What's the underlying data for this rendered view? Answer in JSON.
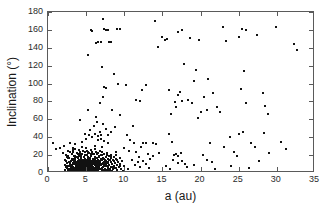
{
  "chart_data": {
    "type": "scatter",
    "title": "",
    "xlabel": "a (au)",
    "ylabel": "Inclination (°)",
    "xlim": [
      0,
      35
    ],
    "ylim": [
      0,
      180
    ],
    "xticks": [
      0,
      5,
      10,
      15,
      20,
      25,
      30,
      35
    ],
    "yticks": [
      0,
      20,
      40,
      60,
      80,
      100,
      120,
      140,
      160,
      180
    ],
    "xtick_labels": [
      "0",
      "5",
      "10",
      "15",
      "20",
      "25",
      "30",
      "35"
    ],
    "ytick_labels": [
      "0",
      "20",
      "40",
      "60",
      "80",
      "100",
      "120",
      "140",
      "160",
      "180"
    ],
    "grid": false,
    "legend": null,
    "marker": "square",
    "marker_color": "#111111",
    "marker_size_px": 2,
    "frame_color": "#5a5a5a",
    "background": "#ffffff",
    "n_points_approx": 620,
    "points": [
      [
        0.7,
        34
      ],
      [
        1.1,
        27
      ],
      [
        1.6,
        28
      ],
      [
        2.0,
        22
      ],
      [
        2.1,
        30
      ],
      [
        2.2,
        14
      ],
      [
        2.3,
        8
      ],
      [
        2.4,
        20
      ],
      [
        2.5,
        11
      ],
      [
        2.6,
        25
      ],
      [
        2.7,
        5
      ],
      [
        2.8,
        17
      ],
      [
        2.9,
        9
      ],
      [
        3.0,
        13
      ],
      [
        3.0,
        3
      ],
      [
        3.1,
        21
      ],
      [
        3.1,
        7
      ],
      [
        3.2,
        16
      ],
      [
        3.2,
        2
      ],
      [
        3.3,
        24
      ],
      [
        3.3,
        10
      ],
      [
        3.4,
        6
      ],
      [
        3.4,
        19
      ],
      [
        3.5,
        12
      ],
      [
        3.5,
        4
      ],
      [
        3.6,
        27
      ],
      [
        3.6,
        15
      ],
      [
        3.7,
        8
      ],
      [
        3.7,
        1
      ],
      [
        3.8,
        22
      ],
      [
        3.8,
        11
      ],
      [
        3.9,
        18
      ],
      [
        3.9,
        5
      ],
      [
        4.0,
        26
      ],
      [
        4.0,
        14
      ],
      [
        4.0,
        3
      ],
      [
        4.1,
        20
      ],
      [
        4.1,
        9
      ],
      [
        4.2,
        24
      ],
      [
        4.2,
        12
      ],
      [
        4.2,
        2
      ],
      [
        4.3,
        17
      ],
      [
        4.3,
        7
      ],
      [
        4.4,
        29
      ],
      [
        4.4,
        15
      ],
      [
        4.4,
        4
      ],
      [
        4.5,
        21
      ],
      [
        4.5,
        10
      ],
      [
        4.6,
        25
      ],
      [
        4.6,
        13
      ],
      [
        4.6,
        1
      ],
      [
        4.7,
        18
      ],
      [
        4.7,
        6
      ],
      [
        4.8,
        23
      ],
      [
        4.8,
        11
      ],
      [
        4.9,
        16
      ],
      [
        4.9,
        3
      ],
      [
        5.0,
        28
      ],
      [
        5.0,
        14
      ],
      [
        5.0,
        8
      ],
      [
        5.1,
        20
      ],
      [
        5.1,
        5
      ],
      [
        5.2,
        24
      ],
      [
        5.2,
        12
      ],
      [
        5.3,
        17
      ],
      [
        5.3,
        2
      ],
      [
        5.4,
        22
      ],
      [
        5.4,
        9
      ],
      [
        5.5,
        15
      ],
      [
        5.5,
        6
      ],
      [
        5.6,
        26
      ],
      [
        5.6,
        11
      ],
      [
        5.7,
        19
      ],
      [
        5.7,
        4
      ],
      [
        5.8,
        23
      ],
      [
        5.8,
        13
      ],
      [
        5.9,
        16
      ],
      [
        5.9,
        7
      ],
      [
        6.0,
        21
      ],
      [
        6.0,
        10
      ],
      [
        6.0,
        2
      ],
      [
        6.1,
        27
      ],
      [
        6.1,
        14
      ],
      [
        6.2,
        18
      ],
      [
        6.2,
        5
      ],
      [
        6.3,
        24
      ],
      [
        6.3,
        12
      ],
      [
        6.4,
        17
      ],
      [
        6.4,
        8
      ],
      [
        6.5,
        22
      ],
      [
        6.5,
        3
      ],
      [
        6.6,
        15
      ],
      [
        6.6,
        11
      ],
      [
        6.7,
        19
      ],
      [
        6.7,
        6
      ],
      [
        6.8,
        25
      ],
      [
        6.8,
        13
      ],
      [
        6.9,
        16
      ],
      [
        6.9,
        4
      ],
      [
        7.0,
        20
      ],
      [
        7.0,
        9
      ],
      [
        7.1,
        23
      ],
      [
        7.1,
        14
      ],
      [
        7.2,
        17
      ],
      [
        7.2,
        7
      ],
      [
        7.3,
        12
      ],
      [
        7.3,
        2
      ],
      [
        7.4,
        21
      ],
      [
        7.4,
        10
      ],
      [
        7.5,
        15
      ],
      [
        7.5,
        5
      ],
      [
        7.6,
        18
      ],
      [
        7.6,
        13
      ],
      [
        7.7,
        8
      ],
      [
        7.7,
        22
      ],
      [
        7.8,
        11
      ],
      [
        7.8,
        3
      ],
      [
        7.9,
        16
      ],
      [
        7.9,
        6
      ],
      [
        8.0,
        19
      ],
      [
        8.0,
        9
      ],
      [
        8.1,
        14
      ],
      [
        8.1,
        4
      ],
      [
        8.2,
        12
      ],
      [
        8.2,
        20
      ],
      [
        8.3,
        7
      ],
      [
        8.3,
        17
      ],
      [
        8.4,
        10
      ],
      [
        8.4,
        2
      ],
      [
        8.5,
        15
      ],
      [
        8.5,
        5
      ],
      [
        8.6,
        13
      ],
      [
        8.7,
        8
      ],
      [
        8.7,
        18
      ],
      [
        8.8,
        11
      ],
      [
        8.9,
        6
      ],
      [
        8.9,
        16
      ],
      [
        9.0,
        9
      ],
      [
        9.0,
        3
      ],
      [
        9.1,
        14
      ],
      [
        9.2,
        12
      ],
      [
        9.3,
        7
      ],
      [
        9.4,
        17
      ],
      [
        9.5,
        10
      ],
      [
        9.6,
        5
      ],
      [
        9.7,
        13
      ],
      [
        9.9,
        8
      ],
      [
        4.2,
        59
      ],
      [
        5.3,
        70
      ],
      [
        5.5,
        48
      ],
      [
        6.0,
        52
      ],
      [
        6.2,
        44
      ],
      [
        6.4,
        57
      ],
      [
        6.6,
        41
      ],
      [
        6.8,
        46
      ],
      [
        7.0,
        38
      ],
      [
        7.2,
        55
      ],
      [
        7.4,
        36
      ],
      [
        7.6,
        49
      ],
      [
        7.8,
        33
      ],
      [
        5.2,
        132
      ],
      [
        5.6,
        160
      ],
      [
        5.8,
        159
      ],
      [
        6.3,
        145
      ],
      [
        6.5,
        146
      ],
      [
        6.9,
        147
      ],
      [
        7.2,
        172
      ],
      [
        7.3,
        161
      ],
      [
        7.6,
        160
      ],
      [
        7.8,
        160
      ],
      [
        8.0,
        146
      ],
      [
        8.3,
        146
      ],
      [
        9.1,
        161
      ],
      [
        9.4,
        161
      ],
      [
        7.1,
        118
      ],
      [
        7.4,
        96
      ],
      [
        7.6,
        95
      ],
      [
        7.2,
        85
      ],
      [
        6.8,
        78
      ],
      [
        8.4,
        70
      ],
      [
        8.8,
        51
      ],
      [
        9.5,
        65
      ],
      [
        9.2,
        99
      ],
      [
        8.6,
        111
      ],
      [
        10.3,
        42
      ],
      [
        10.8,
        37
      ],
      [
        11.3,
        33
      ],
      [
        11.6,
        23
      ],
      [
        11.9,
        18
      ],
      [
        12.2,
        29
      ],
      [
        12.5,
        34
      ],
      [
        12.8,
        33
      ],
      [
        13.1,
        21
      ],
      [
        13.4,
        16
      ],
      [
        13.7,
        34
      ],
      [
        11.0,
        14
      ],
      [
        11.4,
        9
      ],
      [
        11.8,
        12
      ],
      [
        12.0,
        7
      ],
      [
        12.4,
        13
      ],
      [
        12.9,
        10
      ],
      [
        13.3,
        6
      ],
      [
        13.8,
        19
      ],
      [
        14.2,
        32
      ],
      [
        14.6,
        22
      ],
      [
        10.0,
        28
      ],
      [
        10.6,
        25
      ],
      [
        11.2,
        52
      ],
      [
        10.2,
        98
      ],
      [
        11.6,
        82
      ],
      [
        12.3,
        93
      ],
      [
        12.8,
        98
      ],
      [
        12.1,
        80
      ],
      [
        14.0,
        170
      ],
      [
        14.9,
        152
      ],
      [
        15.6,
        150
      ],
      [
        15.3,
        149
      ],
      [
        14.4,
        141
      ],
      [
        15.9,
        44
      ],
      [
        16.2,
        35
      ],
      [
        16.5,
        20
      ],
      [
        16.8,
        21
      ],
      [
        17.1,
        19
      ],
      [
        17.4,
        22
      ],
      [
        15.5,
        8
      ],
      [
        16.0,
        5
      ],
      [
        16.4,
        14
      ],
      [
        17.0,
        11
      ],
      [
        17.6,
        13
      ],
      [
        18.2,
        7
      ],
      [
        16.1,
        66
      ],
      [
        16.6,
        79
      ],
      [
        17.0,
        87
      ],
      [
        17.3,
        91
      ],
      [
        17.6,
        81
      ],
      [
        16.8,
        74
      ],
      [
        15.9,
        93
      ],
      [
        17.8,
        122
      ],
      [
        17.5,
        160
      ],
      [
        17.1,
        158
      ],
      [
        18.4,
        82
      ],
      [
        18.9,
        78
      ],
      [
        19.4,
        115
      ],
      [
        19.1,
        103
      ],
      [
        19.8,
        149
      ],
      [
        18.6,
        151
      ],
      [
        19.6,
        62
      ],
      [
        20.1,
        68
      ],
      [
        20.5,
        85
      ],
      [
        20.9,
        70
      ],
      [
        21.3,
        33
      ],
      [
        20.3,
        20
      ],
      [
        20.8,
        15
      ],
      [
        21.5,
        12
      ],
      [
        21.9,
        5
      ],
      [
        21.0,
        105
      ],
      [
        21.6,
        90
      ],
      [
        22.1,
        74
      ],
      [
        22.5,
        68
      ],
      [
        22.9,
        163
      ],
      [
        23.3,
        148
      ],
      [
        23.1,
        29
      ],
      [
        23.8,
        40
      ],
      [
        24.4,
        24
      ],
      [
        24.8,
        19
      ],
      [
        25.1,
        44
      ],
      [
        25.5,
        46
      ],
      [
        25.9,
        78
      ],
      [
        25.3,
        94
      ],
      [
        25.7,
        114
      ],
      [
        25.4,
        161
      ],
      [
        26.0,
        160
      ],
      [
        25.1,
        152
      ],
      [
        26.6,
        33
      ],
      [
        27.1,
        29
      ],
      [
        27.6,
        13
      ],
      [
        27.4,
        154
      ],
      [
        28.2,
        90
      ],
      [
        28.5,
        75
      ],
      [
        28.9,
        66
      ],
      [
        28.3,
        45
      ],
      [
        29.0,
        22
      ],
      [
        29.9,
        163
      ],
      [
        30.6,
        35
      ],
      [
        31.2,
        27
      ],
      [
        32.2,
        144
      ],
      [
        32.6,
        137
      ],
      [
        24.0,
        8
      ],
      [
        26.3,
        6
      ],
      [
        18.0,
        10
      ],
      [
        19.2,
        9
      ],
      [
        10.5,
        4
      ],
      [
        9.8,
        2
      ],
      [
        8.9,
        24
      ],
      [
        4.5,
        35
      ],
      [
        5.0,
        38
      ],
      [
        5.8,
        40
      ],
      [
        6.6,
        37
      ],
      [
        3.6,
        32
      ],
      [
        2.9,
        34
      ],
      [
        4.9,
        44
      ],
      [
        5.4,
        43
      ],
      [
        6.1,
        30
      ],
      [
        3.3,
        28
      ],
      [
        2.6,
        19
      ],
      [
        7.9,
        42
      ],
      [
        8.2,
        46
      ],
      [
        6.3,
        63
      ],
      [
        7.0,
        43
      ]
    ]
  },
  "axes": {
    "x_title": "a (au)",
    "y_title": "Inclination (°)"
  }
}
